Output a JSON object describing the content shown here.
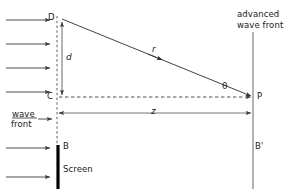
{
  "diagram": {
    "type": "optics-geometry",
    "colors": {
      "line": "#3a3a3a",
      "dashed": "#4a4a4a",
      "screen": "#000000",
      "text": "#1a1a1a",
      "background": "#ffffff"
    },
    "points": {
      "D": "D",
      "C": "C",
      "P": "P",
      "B": "B",
      "B_prime": "B'"
    },
    "variables": {
      "d": "d",
      "r": "r",
      "z": "z",
      "theta": "θ"
    },
    "labels": {
      "advanced_wave_front_line1": "advanced",
      "advanced_wave_front_line2": "wave front",
      "wave_front_line1": "wave",
      "wave_front_line2": "front",
      "screen": "Screen"
    },
    "geometry": {
      "left_axis_x": 57,
      "right_axis_x": 253,
      "point_D_y": 19,
      "point_C_y": 97,
      "point_P_y": 97,
      "screen_top_y": 145,
      "screen_bottom_y": 189,
      "d_arrow_x": 62,
      "z_line_y": 113,
      "incoming_arrow_count": 7,
      "incoming_arrow_x_start": 6,
      "incoming_arrow_x_end": 52,
      "incoming_arrow_ys": [
        20,
        44,
        68,
        92,
        119,
        148,
        177
      ]
    }
  }
}
